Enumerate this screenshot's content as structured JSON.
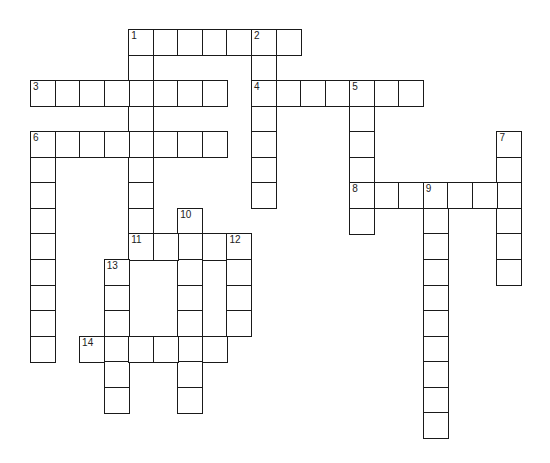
{
  "puzzle": {
    "type": "crossword",
    "grid": {
      "origin_x": 30,
      "origin_y": 29,
      "cell_w": 24.55,
      "cell_h": 25.56,
      "cols": 20,
      "rows": 16
    },
    "colors": {
      "border": "#1a1a1a",
      "background": "#ffffff",
      "number": "#222222"
    },
    "entries": [
      {
        "number": "1",
        "direction": "across",
        "row": 0,
        "col": 4,
        "length": 7
      },
      {
        "number": "1",
        "direction": "down",
        "row": 0,
        "col": 4,
        "length": 9
      },
      {
        "number": "2",
        "direction": "down",
        "row": 0,
        "col": 9,
        "length": 7
      },
      {
        "number": "3",
        "direction": "across",
        "row": 2,
        "col": 0,
        "length": 8
      },
      {
        "number": "4",
        "direction": "across",
        "row": 2,
        "col": 9,
        "length": 7
      },
      {
        "number": "5",
        "direction": "down",
        "row": 2,
        "col": 13,
        "length": 6
      },
      {
        "number": "6",
        "direction": "across",
        "row": 4,
        "col": 0,
        "length": 8
      },
      {
        "number": "6",
        "direction": "down",
        "row": 4,
        "col": 0,
        "length": 9
      },
      {
        "number": "7",
        "direction": "down",
        "row": 4,
        "col": 19,
        "length": 6
      },
      {
        "number": "8",
        "direction": "across",
        "row": 6,
        "col": 13,
        "length": 7
      },
      {
        "number": "9",
        "direction": "down",
        "row": 6,
        "col": 16,
        "length": 10
      },
      {
        "number": "10",
        "direction": "down",
        "row": 7,
        "col": 6,
        "length": 8
      },
      {
        "number": "11",
        "direction": "across",
        "row": 8,
        "col": 4,
        "length": 5
      },
      {
        "number": "12",
        "direction": "down",
        "row": 8,
        "col": 8,
        "length": 4
      },
      {
        "number": "13",
        "direction": "down",
        "row": 9,
        "col": 3,
        "length": 6
      },
      {
        "number": "14",
        "direction": "across",
        "row": 12,
        "col": 2,
        "length": 6
      }
    ]
  }
}
